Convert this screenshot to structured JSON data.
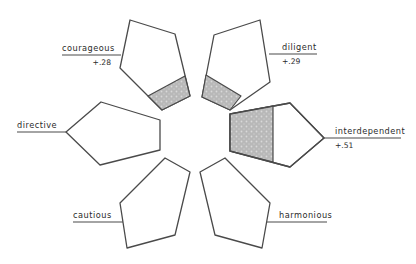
{
  "diagram": {
    "type": "flower-profile",
    "colors": {
      "stroke": "#4a4a4a",
      "shade_fill": "#b8b8b8",
      "shade_dot": "#d9d9d9",
      "text": "#2b2b2b"
    },
    "petals": [
      {
        "id": "courageous",
        "label": "courageous",
        "value": "+.28",
        "points": "130,20 175,34 190,96 162,110 120,68",
        "shade": "148,96 185,76 190,96 162,110",
        "label_x": 62,
        "label_y": 51,
        "value_x": 111,
        "value_y": 65,
        "value_anchor": "end",
        "line": [
          62,
          55,
          121,
          55
        ]
      },
      {
        "id": "diligent",
        "label": "diligent",
        "value": "+.29",
        "points": "214,35 260,20 270,82 230,110 202,97",
        "shade": "206,75 241,96 230,110 202,97",
        "label_x": 282,
        "label_y": 50,
        "value_x": 282,
        "value_y": 64,
        "value_anchor": "start",
        "line": [
          269,
          54,
          317,
          54
        ]
      },
      {
        "id": "interdependent",
        "label": "interdependent",
        "value": "+.51",
        "points": "230,114 290,103 324,138 290,167 230,151",
        "shade": "230,114 273,106 273,162 230,151",
        "label_x": 335,
        "label_y": 134,
        "value_x": 335,
        "value_y": 148,
        "value_anchor": "start",
        "line": [
          324,
          138,
          401,
          138
        ]
      },
      {
        "id": "directive",
        "label": "directive",
        "value": "",
        "points": "66,132 101,102 160,120 160,150 100,165",
        "shade": "",
        "label_x": 17,
        "label_y": 128,
        "value_x": 0,
        "value_y": 0,
        "value_anchor": "start",
        "line": [
          17,
          132,
          66,
          132
        ]
      },
      {
        "id": "cautious",
        "label": "cautious",
        "value": "",
        "points": "120,203 165,158 190,172 175,235 127,248",
        "shade": "",
        "label_x": 73,
        "label_y": 218,
        "value_x": 0,
        "value_y": 0,
        "value_anchor": "start",
        "line": [
          73,
          222,
          123,
          222
        ]
      },
      {
        "id": "harmonious",
        "label": "harmonious",
        "value": "",
        "points": "200,172 225,158 270,203 262,248 215,235",
        "shade": "",
        "label_x": 279,
        "label_y": 218,
        "value_x": 0,
        "value_y": 0,
        "value_anchor": "start",
        "line": [
          267,
          222,
          327,
          222
        ]
      }
    ]
  }
}
